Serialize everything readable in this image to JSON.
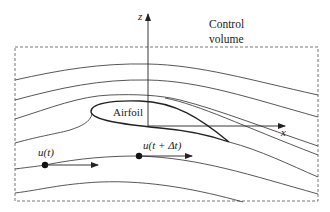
{
  "diagram": {
    "labels": {
      "z_axis": "z",
      "x_axis": "x",
      "control_volume_line1": "Control",
      "control_volume_line2": "volume",
      "airfoil": "Airfoil",
      "u_t": "u(t)",
      "u_t_dt": "u(t + Δt)"
    },
    "colors": {
      "line": "#333333",
      "dash": "#666666",
      "background": "#ffffff"
    }
  }
}
